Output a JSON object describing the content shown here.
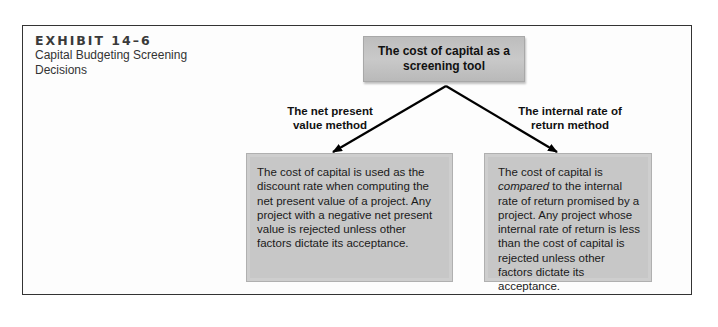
{
  "exhibit": {
    "number_label": "EXHIBIT 14–6",
    "title": "Capital Budgeting Screening Decisions"
  },
  "diagram": {
    "root": {
      "label": "The cost of capital as a screening tool"
    },
    "branches": [
      {
        "method_label": "The net present value method",
        "description": "The cost of capital is used as the discount rate when computing the net present value of a project. Any project with a negative net present value is rejected unless other factors dictate its acceptance."
      },
      {
        "method_label": "The internal rate of return method",
        "description_before": "The cost of capital is ",
        "description_emphasis": "compared",
        "description_after": " to the internal rate of return promised by a project. Any project whose internal rate of return is less than the cost of capital is rejected unless other factors dictate its acceptance."
      }
    ],
    "colors": {
      "box_fill": "#c7c7c7",
      "arrow": "#000000",
      "frame": "#333333"
    }
  }
}
